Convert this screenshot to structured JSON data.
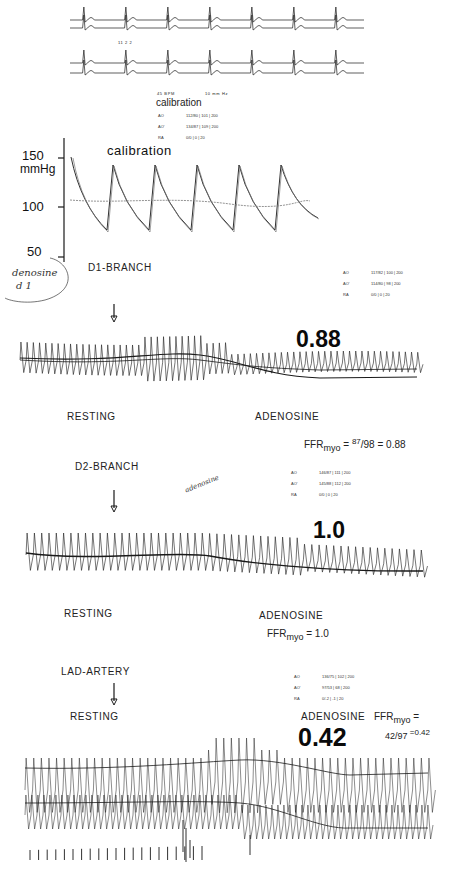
{
  "figure": {
    "top_ecg": {
      "label_small": "11  2 2",
      "header_left": "45 BPM",
      "header_right": "10 mm Hz"
    },
    "calibration_table": {
      "title": "calibration",
      "rows": [
        {
          "key": "AO",
          "value": "112/80 | 101 | 200"
        },
        {
          "key": "AO'",
          "value": "134/87 | 109 | 200"
        },
        {
          "key": "RA",
          "value": "0/0 | 0 | 20"
        }
      ]
    },
    "calibration_panel": {
      "title": "calibration",
      "y_axis": {
        "unit": "mmHg",
        "ticks": [
          "150",
          "100",
          "50"
        ]
      }
    },
    "handwritten_note": {
      "line1": "denosine",
      "line2": "d 1"
    },
    "panel_d1": {
      "site": "D1-BRANCH",
      "ffr_value": "0.88",
      "phase_rest": "RESTING",
      "phase_adenosine": "ADENOSINE",
      "table": [
        {
          "key": "AO",
          "value": "117/82 | 100 | 200"
        },
        {
          "key": "AO'",
          "value": "114/80 | 98 | 200"
        },
        {
          "key": "RA",
          "value": "0/0 | 0 | 20"
        }
      ],
      "ffr_formula": {
        "prefix": "FFR",
        "sub": "myo",
        "eq": " = ",
        "num": "87",
        "den": "/98",
        "result": " = 0.88"
      }
    },
    "panel_d2": {
      "site": "D2-BRANCH",
      "handwritten": "adenosine",
      "ffr_value": "1.0",
      "phase_rest": "RESTING",
      "phase_adenosine": "ADENOSINE",
      "table": [
        {
          "key": "AO",
          "value": "146/87 | 111 | 200"
        },
        {
          "key": "AO'",
          "value": "145/88 | 112 | 200"
        },
        {
          "key": "RA",
          "value": "0/0 | 0 | 20"
        }
      ],
      "ffr_formula": {
        "prefix": "FFR",
        "sub": "myo",
        "result": " = 1.0"
      }
    },
    "panel_lad": {
      "site": "LAD-ARTERY",
      "ffr_value": "0.42",
      "phase_rest": "RESTING",
      "phase_adenosine": "ADENOSINE",
      "table": [
        {
          "key": "AO",
          "value": "136/75 | 102 | 200"
        },
        {
          "key": "AO'",
          "value": "97/53 | 68 | 200"
        },
        {
          "key": "RA",
          "value": "0/-2 | -1 | 20"
        }
      ],
      "ffr_formula": {
        "prefix": "FFR",
        "sub": "myo",
        "eq": " =",
        "frac": "42/97",
        "result": " =0.42"
      }
    },
    "colors": {
      "ink": "#1a1a1a",
      "paper": "#ffffff",
      "trace_light": "#777777"
    }
  }
}
